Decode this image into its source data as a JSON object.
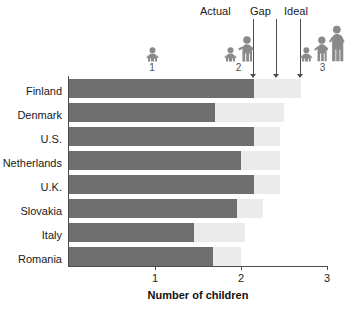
{
  "chart_data": {
    "type": "bar",
    "orientation": "horizontal",
    "stacked": true,
    "title": "",
    "xlabel": "Number of children",
    "ylabel": "",
    "xlim": [
      0,
      3
    ],
    "xticks": [
      1,
      2,
      3
    ],
    "xtick_labels": [
      "1",
      "2",
      "3"
    ],
    "grid": false,
    "categories": [
      "Finland",
      "Denmark",
      "U.S.",
      "Netherlands",
      "U.K.",
      "Slovakia",
      "Italy",
      "Romania"
    ],
    "series": [
      {
        "name": "Actual",
        "color": "#6e6e6e",
        "values": [
          2.15,
          1.7,
          2.15,
          2.0,
          2.15,
          1.95,
          1.45,
          1.68
        ]
      },
      {
        "name": "Ideal",
        "color": "#ebebeb",
        "values": [
          2.7,
          2.5,
          2.45,
          2.45,
          2.45,
          2.25,
          2.05,
          2.0
        ]
      }
    ],
    "gap_values": [
      0.55,
      0.8,
      0.3,
      0.45,
      0.3,
      0.3,
      0.6,
      0.32
    ],
    "annotations": [
      {
        "label": "Actual",
        "x": 2.15
      },
      {
        "label": "Gap",
        "x": 2.6
      },
      {
        "label": "Ideal",
        "x": 2.7
      }
    ],
    "icon_markers": [
      {
        "label": "1",
        "x": 1.0,
        "children": 1
      },
      {
        "label": "2",
        "x": 2.0,
        "children": 2
      },
      {
        "label": "3",
        "x": 3.0,
        "children": 3
      }
    ],
    "legend_position": "top"
  },
  "colors": {
    "actual": "#6e6e6e",
    "ideal": "#ebebeb",
    "axis": "#4d4d4d",
    "text": "#1a1a1a",
    "icon": "#8a8a8a",
    "background": "#ffffff"
  },
  "icons": {
    "baby": "baby-figure-icon",
    "child": "child-figure-icon",
    "adult": "adult-figure-icon"
  }
}
